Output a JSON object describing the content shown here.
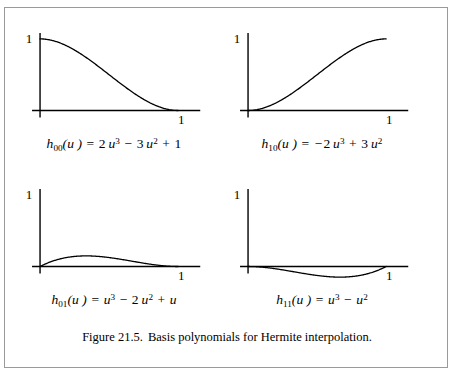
{
  "figure": {
    "caption_number": "Figure 21.5.",
    "caption_text": "Basis polynomials for Hermite interpolation.",
    "border_color": "#9a9a9a",
    "background": "#ffffff",
    "curve_color": "#000000",
    "axis_color": "#000000"
  },
  "chart_data": [
    {
      "type": "line",
      "id": "h00",
      "title": "h00(u) = 2u^3 - 3u^2 + 1",
      "formula_plain": "h00(u) = 2u3 − 3u2 + 1",
      "coefficients": {
        "u3": 2,
        "u2": -3,
        "u1": 0,
        "u0": 1
      },
      "xlabel": "",
      "ylabel": "",
      "xlim": [
        -0.08,
        1.18
      ],
      "ylim": [
        -0.3,
        1.18
      ],
      "x_tick_labels": [
        "1"
      ],
      "x_ticks": [
        1
      ],
      "y_tick_labels": [
        "1"
      ],
      "y_ticks": [
        1
      ],
      "grid": false,
      "legend": "none",
      "points": [
        {
          "u": 0.0,
          "h": 1.0
        },
        {
          "u": 0.1,
          "h": 0.972
        },
        {
          "u": 0.2,
          "h": 0.896
        },
        {
          "u": 0.3,
          "h": 0.784
        },
        {
          "u": 0.4,
          "h": 0.648
        },
        {
          "u": 0.5,
          "h": 0.5
        },
        {
          "u": 0.6,
          "h": 0.352
        },
        {
          "u": 0.7,
          "h": 0.216
        },
        {
          "u": 0.8,
          "h": 0.104
        },
        {
          "u": 0.9,
          "h": 0.028
        },
        {
          "u": 1.0,
          "h": 0.0
        }
      ]
    },
    {
      "type": "line",
      "id": "h10",
      "title": "h10(u) = -2u^3 + 3u^2",
      "formula_plain": "h10(u) = −2u3 + 3u2",
      "coefficients": {
        "u3": -2,
        "u2": 3,
        "u1": 0,
        "u0": 0
      },
      "xlabel": "",
      "ylabel": "",
      "xlim": [
        -0.08,
        1.18
      ],
      "ylim": [
        -0.3,
        1.18
      ],
      "x_tick_labels": [
        "1"
      ],
      "x_ticks": [
        1
      ],
      "y_tick_labels": [
        "1"
      ],
      "y_ticks": [
        1
      ],
      "grid": false,
      "legend": "none",
      "points": [
        {
          "u": 0.0,
          "h": 0.0
        },
        {
          "u": 0.1,
          "h": 0.028
        },
        {
          "u": 0.2,
          "h": 0.104
        },
        {
          "u": 0.3,
          "h": 0.216
        },
        {
          "u": 0.4,
          "h": 0.352
        },
        {
          "u": 0.5,
          "h": 0.5
        },
        {
          "u": 0.6,
          "h": 0.648
        },
        {
          "u": 0.7,
          "h": 0.784
        },
        {
          "u": 0.8,
          "h": 0.896
        },
        {
          "u": 0.9,
          "h": 0.972
        },
        {
          "u": 1.0,
          "h": 1.0
        }
      ]
    },
    {
      "type": "line",
      "id": "h01",
      "title": "h01(u) = u^3 - 2u^2 + u",
      "formula_plain": "h01(u) = u3 − 2u2 + u",
      "coefficients": {
        "u3": 1,
        "u2": -2,
        "u1": 1,
        "u0": 0
      },
      "xlabel": "",
      "ylabel": "",
      "xlim": [
        -0.08,
        1.18
      ],
      "ylim": [
        -0.3,
        1.18
      ],
      "x_tick_labels": [
        "1"
      ],
      "x_ticks": [
        1
      ],
      "y_tick_labels": [
        "1"
      ],
      "y_ticks": [
        1
      ],
      "grid": false,
      "legend": "none",
      "peak": {
        "u": 0.3333,
        "h": 0.1481
      },
      "points": [
        {
          "u": 0.0,
          "h": 0.0
        },
        {
          "u": 0.1,
          "h": 0.081
        },
        {
          "u": 0.2,
          "h": 0.128
        },
        {
          "u": 0.3,
          "h": 0.147
        },
        {
          "u": 0.4,
          "h": 0.144
        },
        {
          "u": 0.5,
          "h": 0.125
        },
        {
          "u": 0.6,
          "h": 0.096
        },
        {
          "u": 0.7,
          "h": 0.063
        },
        {
          "u": 0.8,
          "h": 0.032
        },
        {
          "u": 0.9,
          "h": 0.009
        },
        {
          "u": 1.0,
          "h": 0.0
        }
      ]
    },
    {
      "type": "line",
      "id": "h11",
      "title": "h11(u) = u^3 - u^2",
      "formula_plain": "h11(u) = u3 − u2",
      "coefficients": {
        "u3": 1,
        "u2": -1,
        "u1": 0,
        "u0": 0
      },
      "xlabel": "",
      "ylabel": "",
      "xlim": [
        -0.08,
        1.18
      ],
      "ylim": [
        -0.3,
        1.18
      ],
      "x_tick_labels": [
        "1"
      ],
      "x_ticks": [
        1
      ],
      "y_tick_labels": [
        "1"
      ],
      "y_ticks": [
        1
      ],
      "grid": false,
      "legend": "none",
      "trough": {
        "u": 0.6667,
        "h": -0.1481
      },
      "points": [
        {
          "u": 0.0,
          "h": 0.0
        },
        {
          "u": 0.1,
          "h": -0.009
        },
        {
          "u": 0.2,
          "h": -0.032
        },
        {
          "u": 0.3,
          "h": -0.063
        },
        {
          "u": 0.4,
          "h": -0.096
        },
        {
          "u": 0.5,
          "h": -0.125
        },
        {
          "u": 0.6,
          "h": -0.144
        },
        {
          "u": 0.7,
          "h": -0.147
        },
        {
          "u": 0.8,
          "h": -0.128
        },
        {
          "u": 0.9,
          "h": -0.081
        },
        {
          "u": 1.0,
          "h": 0.0
        }
      ]
    }
  ],
  "formulas": [
    {
      "fn": "h",
      "sub": "00",
      "arg": "(u )",
      "eq": "=",
      "rhs": [
        {
          "sign": "",
          "coef": "2",
          "var": "u",
          "pow": "3"
        },
        {
          "sign": "−",
          "coef": "3",
          "var": "u",
          "pow": "2"
        },
        {
          "sign": "+",
          "coef": "1",
          "var": "",
          "pow": ""
        }
      ]
    },
    {
      "fn": "h",
      "sub": "10",
      "arg": "(u )",
      "eq": "=",
      "rhs": [
        {
          "sign": "−",
          "coef": "2",
          "var": "u",
          "pow": "3"
        },
        {
          "sign": "+",
          "coef": "3",
          "var": "u",
          "pow": "2"
        }
      ]
    },
    {
      "fn": "h",
      "sub": "01",
      "arg": "(u )",
      "eq": "=",
      "rhs": [
        {
          "sign": "",
          "coef": "",
          "var": "u",
          "pow": "3"
        },
        {
          "sign": "−",
          "coef": "2",
          "var": "u",
          "pow": "2"
        },
        {
          "sign": "+",
          "coef": "",
          "var": "u",
          "pow": ""
        }
      ]
    },
    {
      "fn": "h",
      "sub": "11",
      "arg": "(u )",
      "eq": "=",
      "rhs": [
        {
          "sign": "",
          "coef": "",
          "var": "u",
          "pow": "3"
        },
        {
          "sign": "−",
          "coef": "",
          "var": "u",
          "pow": "2"
        }
      ]
    }
  ]
}
